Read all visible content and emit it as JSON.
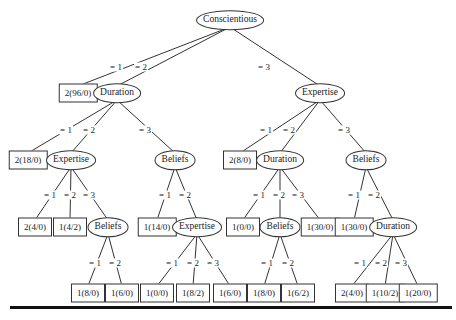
{
  "diagram": {
    "type": "decision-tree",
    "nodes": [
      {
        "id": "n0",
        "kind": "attribute",
        "label": "Conscientious",
        "x": 230,
        "y": 20
      },
      {
        "id": "n1",
        "kind": "leaf",
        "label": "2(96/0)",
        "x": 78,
        "y": 93
      },
      {
        "id": "n2",
        "kind": "attribute",
        "label": "Duration",
        "x": 117,
        "y": 93
      },
      {
        "id": "n3",
        "kind": "attribute",
        "label": "Expertise",
        "x": 320,
        "y": 93
      },
      {
        "id": "n4",
        "kind": "leaf",
        "label": "2(18/0)",
        "x": 28,
        "y": 160
      },
      {
        "id": "n5",
        "kind": "attribute",
        "label": "Expertise",
        "x": 71,
        "y": 160
      },
      {
        "id": "n6",
        "kind": "attribute",
        "label": "Beliefs",
        "x": 175,
        "y": 160
      },
      {
        "id": "n7",
        "kind": "leaf",
        "label": "2(8/0)",
        "x": 240,
        "y": 160
      },
      {
        "id": "n8",
        "kind": "attribute",
        "label": "Duration",
        "x": 280,
        "y": 160
      },
      {
        "id": "n9",
        "kind": "attribute",
        "label": "Beliefs",
        "x": 366,
        "y": 160
      },
      {
        "id": "n10",
        "kind": "leaf",
        "label": "2(4/0)",
        "x": 35,
        "y": 227
      },
      {
        "id": "n11",
        "kind": "leaf",
        "label": "1(4/2)",
        "x": 70,
        "y": 227
      },
      {
        "id": "n12",
        "kind": "attribute",
        "label": "Beliefs",
        "x": 108,
        "y": 227
      },
      {
        "id": "n13",
        "kind": "leaf",
        "label": "1(14/0)",
        "x": 157,
        "y": 227
      },
      {
        "id": "n14",
        "kind": "attribute",
        "label": "Expertise",
        "x": 197,
        "y": 227
      },
      {
        "id": "n15",
        "kind": "leaf",
        "label": "1(0/0)",
        "x": 243,
        "y": 227
      },
      {
        "id": "n16",
        "kind": "attribute",
        "label": "Beliefs",
        "x": 280,
        "y": 227
      },
      {
        "id": "n17",
        "kind": "leaf",
        "label": "1(30/0)",
        "x": 320,
        "y": 227
      },
      {
        "id": "n18",
        "kind": "leaf",
        "label": "1(30/0)",
        "x": 354,
        "y": 227
      },
      {
        "id": "n19",
        "kind": "attribute",
        "label": "Duration",
        "x": 393,
        "y": 227
      },
      {
        "id": "n20",
        "kind": "leaf",
        "label": "1(8/0)",
        "x": 88,
        "y": 293
      },
      {
        "id": "n21",
        "kind": "leaf",
        "label": "1(6/0)",
        "x": 122,
        "y": 293
      },
      {
        "id": "n22",
        "kind": "leaf",
        "label": "1(0/0)",
        "x": 157,
        "y": 293
      },
      {
        "id": "n23",
        "kind": "leaf",
        "label": "1(8/2)",
        "x": 193,
        "y": 293
      },
      {
        "id": "n24",
        "kind": "leaf",
        "label": "1(6/0)",
        "x": 230,
        "y": 293
      },
      {
        "id": "n25",
        "kind": "leaf",
        "label": "1(8/0)",
        "x": 264,
        "y": 293
      },
      {
        "id": "n26",
        "kind": "leaf",
        "label": "1(6/2)",
        "x": 298,
        "y": 293
      },
      {
        "id": "n27",
        "kind": "leaf",
        "label": "2(4/0)",
        "x": 352,
        "y": 293
      },
      {
        "id": "n28",
        "kind": "leaf",
        "label": "1(10/2)",
        "x": 385,
        "y": 293
      },
      {
        "id": "n29",
        "kind": "leaf",
        "label": "1(20/0)",
        "x": 418,
        "y": 293
      }
    ],
    "edges": [
      {
        "from": "n0",
        "to": "n1",
        "label": "= 1",
        "lx": 116,
        "ly": 67
      },
      {
        "from": "n0",
        "to": "n2",
        "label": "= 2",
        "lx": 141,
        "ly": 67
      },
      {
        "from": "n0",
        "to": "n3",
        "label": "= 3",
        "lx": 264,
        "ly": 67
      },
      {
        "from": "n2",
        "to": "n4",
        "label": "= 1",
        "lx": 66,
        "ly": 130
      },
      {
        "from": "n2",
        "to": "n5",
        "label": "= 2",
        "lx": 89,
        "ly": 130
      },
      {
        "from": "n2",
        "to": "n6",
        "label": "= 3",
        "lx": 145,
        "ly": 130
      },
      {
        "from": "n3",
        "to": "n7",
        "label": "= 1",
        "lx": 266,
        "ly": 130
      },
      {
        "from": "n3",
        "to": "n8",
        "label": "= 2",
        "lx": 289,
        "ly": 130
      },
      {
        "from": "n3",
        "to": "n9",
        "label": "= 3",
        "lx": 344,
        "ly": 130
      },
      {
        "from": "n5",
        "to": "n10",
        "label": "= 1",
        "lx": 50,
        "ly": 195
      },
      {
        "from": "n5",
        "to": "n11",
        "label": "= 2",
        "lx": 70,
        "ly": 195
      },
      {
        "from": "n5",
        "to": "n12",
        "label": "= 3",
        "lx": 89,
        "ly": 195
      },
      {
        "from": "n6",
        "to": "n13",
        "label": "= 1",
        "lx": 165,
        "ly": 195
      },
      {
        "from": "n6",
        "to": "n14",
        "label": "= 2",
        "lx": 185,
        "ly": 195
      },
      {
        "from": "n8",
        "to": "n15",
        "label": "= 1",
        "lx": 259,
        "ly": 195
      },
      {
        "from": "n8",
        "to": "n16",
        "label": "= 2",
        "lx": 279,
        "ly": 195
      },
      {
        "from": "n8",
        "to": "n17",
        "label": "= 3",
        "lx": 298,
        "ly": 195
      },
      {
        "from": "n9",
        "to": "n18",
        "label": "= 1",
        "lx": 354,
        "ly": 195
      },
      {
        "from": "n9",
        "to": "n19",
        "label": "= 2",
        "lx": 374,
        "ly": 195
      },
      {
        "from": "n12",
        "to": "n20",
        "label": "= 1",
        "lx": 95,
        "ly": 263
      },
      {
        "from": "n12",
        "to": "n21",
        "label": "= 2",
        "lx": 115,
        "ly": 263
      },
      {
        "from": "n14",
        "to": "n22",
        "label": "= 1",
        "lx": 172,
        "ly": 263
      },
      {
        "from": "n14",
        "to": "n23",
        "label": "= 2",
        "lx": 193,
        "ly": 263
      },
      {
        "from": "n14",
        "to": "n24",
        "label": "= 3",
        "lx": 213,
        "ly": 263
      },
      {
        "from": "n16",
        "to": "n25",
        "label": "= 1",
        "lx": 267,
        "ly": 263
      },
      {
        "from": "n16",
        "to": "n26",
        "label": "= 2",
        "lx": 288,
        "ly": 263
      },
      {
        "from": "n19",
        "to": "n27",
        "label": "= 1",
        "lx": 360,
        "ly": 263
      },
      {
        "from": "n19",
        "to": "n28",
        "label": "= 2",
        "lx": 381,
        "ly": 263
      },
      {
        "from": "n19",
        "to": "n29",
        "label": "= 3",
        "lx": 401,
        "ly": 263
      }
    ]
  }
}
